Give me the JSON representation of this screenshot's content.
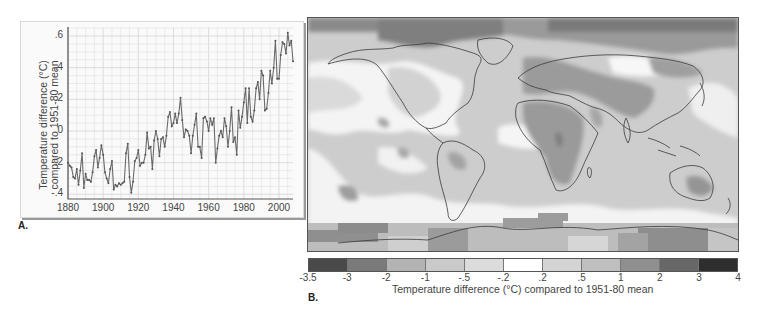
{
  "panel_a": {
    "letter": "A.",
    "ylabel_line1": "Temperature difference (°C)",
    "ylabel_line2": "compared to 1951-80 mean",
    "yticks": [
      ".6",
      ".4",
      ".2",
      "0",
      "-.2",
      "-.4"
    ],
    "xticks": [
      "1880",
      "1900",
      "1920",
      "1940",
      "1960",
      "1980",
      "2000"
    ]
  },
  "panel_b": {
    "letter": "B.",
    "colorbar_ticks": [
      "-3.5",
      "-3",
      "-2",
      "-1",
      "-.5",
      "-.2",
      ".2",
      ".5",
      "1",
      "2",
      "3",
      "4"
    ],
    "colorbar_colors": [
      "#4a4a4a",
      "#7a7a7a",
      "#b3b3b3",
      "#cacaca",
      "#dcdcdc",
      "#ffffff",
      "#d4d4d4",
      "#bfbfbf",
      "#8f8f8f",
      "#676767",
      "#2e2e2e"
    ],
    "caption": "Temperature difference (°C) compared to 1951-80 mean"
  },
  "chart_data": [
    {
      "type": "line",
      "title": "",
      "xlabel": "",
      "ylabel": "Temperature difference (°C) compared to 1951-80 mean",
      "xlim": [
        1880,
        2008
      ],
      "ylim": [
        -0.4,
        0.65
      ],
      "grid": true,
      "x_ticks": [
        1880,
        1900,
        1920,
        1940,
        1960,
        1980,
        2000
      ],
      "y_ticks": [
        -0.4,
        -0.2,
        0,
        0.2,
        0.4,
        0.6
      ],
      "series": [
        {
          "name": "Global annual mean temperature anomaly",
          "x": [
            1880,
            1881,
            1882,
            1883,
            1884,
            1885,
            1886,
            1887,
            1888,
            1889,
            1890,
            1891,
            1892,
            1893,
            1894,
            1895,
            1896,
            1897,
            1898,
            1899,
            1900,
            1901,
            1902,
            1903,
            1904,
            1905,
            1906,
            1907,
            1908,
            1909,
            1910,
            1911,
            1912,
            1913,
            1914,
            1915,
            1916,
            1917,
            1918,
            1919,
            1920,
            1921,
            1922,
            1923,
            1924,
            1925,
            1926,
            1927,
            1928,
            1929,
            1930,
            1931,
            1932,
            1933,
            1934,
            1935,
            1936,
            1937,
            1938,
            1939,
            1940,
            1941,
            1942,
            1943,
            1944,
            1945,
            1946,
            1947,
            1948,
            1949,
            1950,
            1951,
            1952,
            1953,
            1954,
            1955,
            1956,
            1957,
            1958,
            1959,
            1960,
            1961,
            1962,
            1963,
            1964,
            1965,
            1966,
            1967,
            1968,
            1969,
            1970,
            1971,
            1972,
            1973,
            1974,
            1975,
            1976,
            1977,
            1978,
            1979,
            1980,
            1981,
            1982,
            1983,
            1984,
            1985,
            1986,
            1987,
            1988,
            1989,
            1990,
            1991,
            1992,
            1993,
            1994,
            1995,
            1996,
            1997,
            1998,
            1999,
            2000,
            2001,
            2002,
            2003,
            2004,
            2005,
            2006,
            2007,
            2008
          ],
          "values": [
            -0.2,
            -0.22,
            -0.23,
            -0.29,
            -0.3,
            -0.24,
            -0.34,
            -0.25,
            -0.14,
            -0.36,
            -0.27,
            -0.31,
            -0.31,
            -0.32,
            -0.26,
            -0.16,
            -0.12,
            -0.23,
            -0.17,
            -0.09,
            -0.15,
            -0.26,
            -0.3,
            -0.33,
            -0.24,
            -0.19,
            -0.37,
            -0.34,
            -0.35,
            -0.33,
            -0.34,
            -0.33,
            -0.32,
            -0.14,
            -0.08,
            -0.29,
            -0.39,
            -0.32,
            -0.19,
            -0.17,
            -0.12,
            -0.22,
            -0.2,
            -0.2,
            -0.15,
            -0.01,
            -0.11,
            -0.1,
            -0.24,
            -0.06,
            0.0,
            -0.05,
            -0.16,
            -0.05,
            -0.04,
            -0.1,
            -0.03,
            0.09,
            0.12,
            0.03,
            0.05,
            0.11,
            0.05,
            0.11,
            0.21,
            0.07,
            -0.04,
            0.01,
            0.0,
            -0.03,
            -0.14,
            -0.03,
            0.04,
            0.11,
            -0.1,
            -0.1,
            -0.17,
            0.08,
            0.09,
            0.06,
            0.0,
            0.08,
            0.04,
            0.08,
            -0.2,
            -0.11,
            -0.03,
            0.0,
            -0.04,
            0.08,
            0.03,
            -0.1,
            0.0,
            0.15,
            -0.07,
            -0.04,
            -0.15,
            0.13,
            0.02,
            0.09,
            0.18,
            0.27,
            0.05,
            0.27,
            0.09,
            0.06,
            0.13,
            0.27,
            0.31,
            0.2,
            0.38,
            0.35,
            0.13,
            0.14,
            0.24,
            0.38,
            0.3,
            0.4,
            0.57,
            0.33,
            0.33,
            0.48,
            0.56,
            0.55,
            0.49,
            0.62,
            0.54,
            0.57,
            0.44
          ]
        }
      ]
    },
    {
      "type": "heatmap",
      "title": "Global surface temperature anomaly map",
      "colorbar_label": "Temperature difference (°C) compared to 1951-80 mean",
      "colorbar_bins": [
        -3.5,
        -3,
        -2,
        -1,
        -0.5,
        -0.2,
        0.2,
        0.5,
        1,
        2,
        3,
        4
      ],
      "description": "World map (equirectangular, Pacific-left) with warming anomalies: strongest over Arctic/northern Asia/Siberia, Sahara & central Africa, Middle East, southeastern Australia, and parts of Antarctica; near-zero (white) bands over North Pacific, central North America, and Southern Ocean."
    }
  ]
}
